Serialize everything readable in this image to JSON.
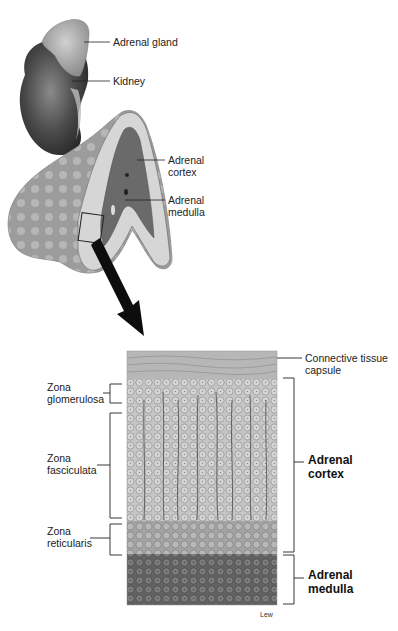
{
  "figure": {
    "top_labels": {
      "adrenal_gland": "Adrenal gland",
      "kidney": "Kidney",
      "adrenal_cortex": [
        "Adrenal",
        "cortex"
      ],
      "adrenal_medulla": [
        "Adrenal",
        "medulla"
      ]
    },
    "section_labels": {
      "capsule": [
        "Connective tissue",
        "capsule"
      ],
      "zona_glomerulosa": [
        "Zona",
        "glomerulosa"
      ],
      "zona_fasciculata": [
        "Zona",
        "fasciculata"
      ],
      "zona_reticularis": [
        "Zona",
        "reticularis"
      ],
      "cortex": [
        "Adrenal",
        "cortex"
      ],
      "medulla": [
        "Adrenal",
        "medulla"
      ]
    },
    "artist_signature": "Lew",
    "colors": {
      "kidney": "#3c3c3c",
      "gland": "#a8a8a8",
      "cortex_tissue": "#c2c2c2",
      "medulla_tissue": "#6e6e6e",
      "capsule": "#b4b4b4",
      "lines": "#1a1a1a"
    }
  }
}
